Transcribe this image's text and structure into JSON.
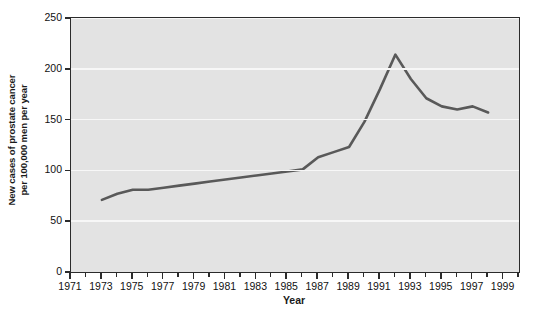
{
  "chart_data": {
    "type": "line",
    "title": "",
    "xlabel": "Year",
    "ylabel": "New cases of prostate cancer per 100,000 men per year",
    "ylabel_lines": [
      "New cases of prostate cancer",
      "per 100,000 men per year"
    ],
    "xlim": [
      1971,
      2000
    ],
    "ylim": [
      0,
      250
    ],
    "yticks": [
      0,
      50,
      100,
      150,
      200,
      250
    ],
    "ytick_labels": [
      "0",
      "50",
      "100",
      "150",
      "200",
      "250"
    ],
    "xticks_major": [
      1971,
      1973,
      1975,
      1977,
      1979,
      1981,
      1983,
      1985,
      1987,
      1989,
      1991,
      1993,
      1995,
      1997,
      1999
    ],
    "xtick_labels": [
      "1971",
      "1973",
      "1975",
      "1977",
      "1979",
      "1981",
      "1983",
      "1985",
      "1987",
      "1989",
      "1991",
      "1993",
      "1995",
      "1997",
      "1999"
    ],
    "xticks_minor": [
      1972,
      1974,
      1976,
      1978,
      1980,
      1982,
      1984,
      1986,
      1988,
      1990,
      1992,
      1994,
      1996,
      1998,
      2000
    ],
    "grid": "horizontal",
    "legend": "none",
    "series": [
      {
        "name": "New prostate cancer cases per 100,000 men",
        "color": "#595959",
        "x": [
          1973,
          1974,
          1975,
          1976,
          1977,
          1978,
          1979,
          1980,
          1981,
          1982,
          1983,
          1984,
          1985,
          1986,
          1987,
          1988,
          1989,
          1990,
          1991,
          1992,
          1993,
          1994,
          1995,
          1996,
          1997,
          1998
        ],
        "values": [
          71,
          77,
          81,
          81,
          83,
          85,
          87,
          89,
          91,
          93,
          95,
          97,
          99,
          101,
          113,
          118,
          123,
          148,
          180,
          214,
          190,
          171,
          163,
          160,
          163,
          157
        ]
      }
    ],
    "colors": {
      "line": "#595959",
      "plot_background": "#e3e3e3",
      "gridline": "#f7f7f7",
      "axis": "#2b2b2b",
      "text": "#111111",
      "page_background": "#ffffff"
    }
  }
}
